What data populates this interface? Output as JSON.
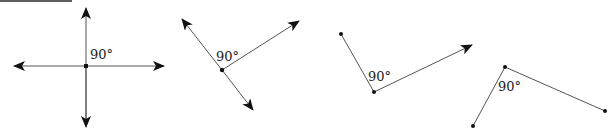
{
  "diagram": {
    "figures": [
      {
        "id": "fig1",
        "description": "Two perpendicular lines (intersecting at center)",
        "angle_label": "90°",
        "vertex": [
          86,
          66
        ],
        "label_pos": [
          90,
          58
        ]
      },
      {
        "id": "fig2",
        "description": "Line and ray forming 90° angle, rotated",
        "angle_label": "90°",
        "vertex": [
          222,
          70
        ],
        "label_pos": [
          216,
          60
        ]
      },
      {
        "id": "fig3",
        "description": "Segment and ray forming 90° angle",
        "angle_label": "90°",
        "vertex": [
          374,
          92
        ],
        "label_pos": [
          368,
          81
        ]
      },
      {
        "id": "fig4",
        "description": "Two segments forming 90° angle",
        "angle_label": "90°",
        "vertex": [
          505,
          67
        ],
        "label_pos": [
          497,
          92
        ]
      }
    ]
  }
}
